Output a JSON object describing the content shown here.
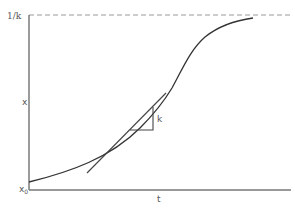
{
  "diagram": {
    "type": "logistic-growth-curve",
    "labels": {
      "asymptote": "1/k",
      "y_axis": "x",
      "origin_main": "x",
      "origin_sub": "0",
      "x_axis": "t",
      "slope": "k"
    },
    "elements": {
      "y_axis": "vertical axis",
      "x_axis": "horizontal axis",
      "asymptote_line": "dashed line at 1/k",
      "curve": "sigmoid curve starting at x0",
      "tangent": "tangent line to curve",
      "slope_triangle": "right triangle indicating slope k"
    },
    "colors": {
      "axis": "#555555",
      "curve": "#333333",
      "dashed": "#999999",
      "text": "#555555"
    }
  }
}
